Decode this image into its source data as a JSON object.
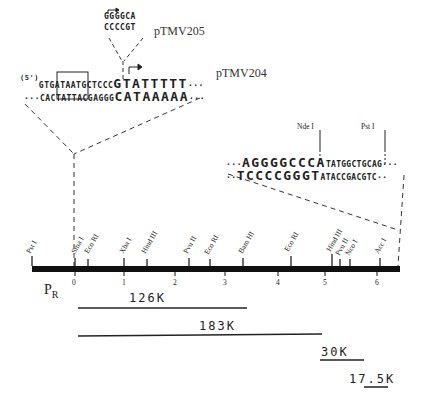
{
  "inset_top": {
    "pTMV205": {
      "label": "pTMV205",
      "top_strand": "GGGGCA",
      "bottom_strand": "CCCCGT"
    },
    "pTMV204": {
      "label": "pTMV204",
      "five_prime_label": "(5')",
      "top_strand_left": "GTG",
      "top_strand_box": "ATAAT",
      "top_strand_mid": "GCTCCC",
      "top_strand_big": "GTATTTTT",
      "top_strand_tail": "···",
      "bottom_strand_lead": "···",
      "bottom_strand_left": "CAC",
      "bottom_strand_box": "TATTA",
      "bottom_strand_mid": "CGAGGG",
      "bottom_strand_big": "CATAAAAA",
      "bottom_strand_tail": "···"
    }
  },
  "inset_right": {
    "nde_label": "Nde I",
    "pst_label": "Pst I",
    "top_lead": "···",
    "top_big": "AGGGGCCCA",
    "top_small": "TATGGCTGCAG",
    "top_tail": "···",
    "bottom_lead": "··",
    "bottom_big": "TCCCCGGGT",
    "bottom_small": "ATACCGACGTC",
    "bottom_tail": "··"
  },
  "map": {
    "promoter_label": "P",
    "promoter_sub": "R",
    "scale": [
      "0",
      "1",
      "2",
      "3",
      "4",
      "5",
      "6"
    ],
    "sites": [
      {
        "name": "Pst I"
      },
      {
        "name": "Sma I"
      },
      {
        "name": "Eco RI"
      },
      {
        "name": "Xba I"
      },
      {
        "name": "Hind III"
      },
      {
        "name": "Pvu II"
      },
      {
        "name": "Eco RI"
      },
      {
        "name": "Bam HI"
      },
      {
        "name": "Eco RI"
      },
      {
        "name": "Hind III"
      },
      {
        "name": "Pvu II"
      },
      {
        "name": "Nco I"
      },
      {
        "name": "Acc I"
      }
    ]
  },
  "proteins": [
    {
      "label": "126K"
    },
    {
      "label": "183K"
    },
    {
      "label": "30K"
    },
    {
      "label": "17.5K"
    }
  ]
}
